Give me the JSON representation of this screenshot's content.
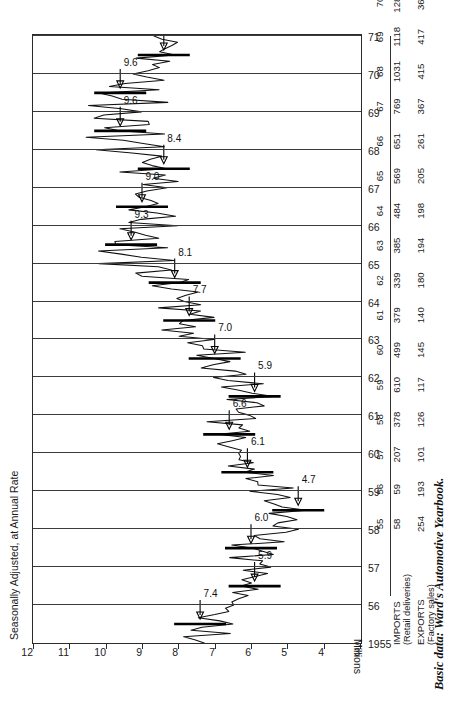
{
  "chart_title": "Seasonally Adjusted, at Annual Rate",
  "units_label": "Millions",
  "source_caption": "Basic data: Ward's Automotive Yearbook.",
  "chart_data": {
    "type": "line",
    "title": "Seasonally Adjusted, at Annual Rate",
    "xlabel": "",
    "ylabel": "Millions",
    "ylim": [
      3,
      12
    ],
    "xlim": [
      1955,
      1971
    ],
    "grid": true,
    "legend": "none",
    "yticks": [
      "12",
      "11",
      "10",
      "9",
      "8",
      "7",
      "6",
      "5",
      "4",
      "3"
    ],
    "ytick_values": [
      12,
      11,
      10,
      9,
      8,
      7,
      6,
      5,
      4,
      3
    ],
    "xticks": [
      "1955",
      "56",
      "57",
      "58",
      "59",
      "60",
      "61",
      "62",
      "63",
      "64",
      "65",
      "66",
      "67",
      "68",
      "69",
      "70",
      "71"
    ],
    "xtick_values": [
      1955,
      1956,
      1957,
      1958,
      1959,
      1960,
      1961,
      1962,
      1963,
      1964,
      1965,
      1966,
      1967,
      1968,
      1969,
      1970,
      1971
    ],
    "annual_average_values": [
      7.4,
      5.9,
      6.0,
      4.7,
      6.1,
      6.6,
      5.9,
      7.0,
      7.7,
      8.1,
      9.3,
      9.0,
      8.4,
      9.6,
      9.6,
      8.4
    ],
    "annual_average_years": [
      1955,
      1956,
      1957,
      1958,
      1959,
      1960,
      1961,
      1962,
      1963,
      1964,
      1965,
      1966,
      1967,
      1968,
      1969,
      1970
    ],
    "annotations": [
      {
        "label": "7.4",
        "year": 1955,
        "value": 7.4
      },
      {
        "label": "5.9",
        "year": 1956,
        "value": 5.9
      },
      {
        "label": "6.0",
        "year": 1957,
        "value": 6.0
      },
      {
        "label": "4.7",
        "year": 1958,
        "value": 4.7
      },
      {
        "label": "6.1",
        "year": 1959,
        "value": 6.1
      },
      {
        "label": "6.6",
        "year": 1960,
        "value": 6.6
      },
      {
        "label": "5.9",
        "year": 1961,
        "value": 5.9
      },
      {
        "label": "7.0",
        "year": 1962,
        "value": 7.0
      },
      {
        "label": "7.7",
        "year": 1963,
        "value": 7.7
      },
      {
        "label": "8.1",
        "year": 1964,
        "value": 8.1
      },
      {
        "label": "9.3",
        "year": 1965,
        "value": 9.3
      },
      {
        "label": "9.0",
        "year": 1966,
        "value": 9.0
      },
      {
        "label": "8.4",
        "year": 1967,
        "value": 8.4
      },
      {
        "label": "9.6",
        "year": 1968,
        "value": 9.6
      },
      {
        "label": "9.6",
        "year": 1969,
        "value": 9.6
      },
      {
        "label": "8.4",
        "year": 1970,
        "value": 8.4
      }
    ]
  },
  "table": {
    "years": [
      "55",
      "56",
      "57",
      "58",
      "59",
      "60",
      "61",
      "62",
      "63",
      "64",
      "65",
      "66",
      "67",
      "68",
      "69",
      "70"
    ],
    "rows": [
      {
        "name": "IMPORTS",
        "sub": "(Retail deliveries)",
        "values": [
          "58",
          "59",
          "207",
          "378",
          "610",
          "499",
          "379",
          "339",
          "385",
          "484",
          "569",
          "651",
          "769",
          "1031",
          "1118",
          "1280"
        ]
      },
      {
        "name": "EXPORTS",
        "sub": "(Factory sales)",
        "values": [
          "254",
          "193",
          "101",
          "126",
          "117",
          "145",
          "140",
          "180",
          "194",
          "198",
          "205",
          "261",
          "367",
          "415",
          "417",
          "360"
        ]
      }
    ]
  }
}
